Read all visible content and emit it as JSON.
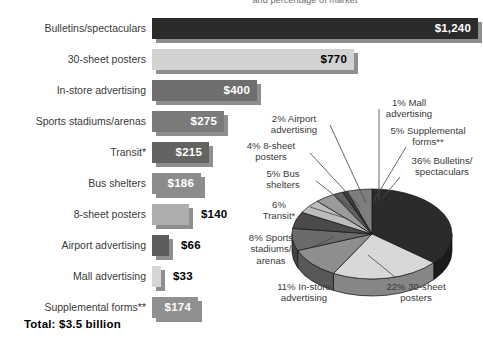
{
  "title": "and percentage of market",
  "total": "Total: $3.5 billion",
  "chart_data": [
    {
      "type": "bar",
      "title": "Outdoor advertising spending by medium",
      "orientation": "horizontal",
      "xlabel": "",
      "ylabel": "",
      "unit": "$ millions",
      "categories": [
        "Bulletins/spectaculars",
        "30-sheet posters",
        "In-store advertising",
        "Sports stadiums/arenas",
        "Transit*",
        "Bus shelters",
        "8-sheet posters",
        "Airport advertising",
        "Mall advertising",
        "Supplemental forms**"
      ],
      "values": [
        1240,
        770,
        400,
        275,
        215,
        186,
        140,
        66,
        33,
        174
      ],
      "value_labels": [
        "$1,240",
        "$770",
        "$400",
        "$275",
        "$215",
        "$186",
        "$140",
        "$66",
        "$33",
        "$174"
      ],
      "colors": [
        "#2b2b2b",
        "#d2d2d2",
        "#6e6e6e",
        "#7b7b7b",
        "#636363",
        "#8c8c8c",
        "#adadad",
        "#5d5d5d",
        "#d6d6d6",
        "#909090"
      ],
      "label_inside": [
        true,
        true,
        true,
        true,
        true,
        true,
        false,
        false,
        false,
        true
      ],
      "label_color": [
        "#ffffff",
        "#000000",
        "#ffffff",
        "#ffffff",
        "#ffffff",
        "#ffffff",
        "#000000",
        "#000000",
        "#000000",
        "#ffffff"
      ],
      "shadow_color": "#8e8e8e",
      "bar_height_px": 21,
      "row_pitch_px": 31,
      "max_value": 1240,
      "max_width_px": 326,
      "grid": false,
      "total": "Total: $3.5 billion"
    },
    {
      "type": "pie",
      "title": "Percentage of market",
      "three_d": true,
      "legend": "callout-labels",
      "labels": [
        "36% Bulletins/spectaculars",
        "22% 30-sheet posters",
        "11% In-store advertising",
        "8% Sports stadiums/arenas",
        "6% Transit*",
        "5% Bus shelters",
        "4% 8-sheet posters",
        "2% Airport advertising",
        "1% Mall advertising",
        "5% Supplemental forms**"
      ],
      "categories": [
        "Bulletins/spectaculars",
        "30-sheet posters",
        "In-store advertising",
        "Sports stadiums/arenas",
        "Transit*",
        "Bus shelters",
        "8-sheet posters",
        "Airport advertising",
        "Mall advertising",
        "Supplemental forms**"
      ],
      "values": [
        36,
        22,
        11,
        8,
        6,
        5,
        4,
        2,
        1,
        5
      ],
      "colors": [
        "#2b2b2b",
        "#d8d8d8",
        "#8e8e8e",
        "#6b6b6b",
        "#4a4a4a",
        "#bdbdbd",
        "#9a9a9a",
        "#636363",
        "#3a3a3a",
        "#7e7e7e"
      ],
      "center_px": [
        372,
        234
      ],
      "radius_x_px": 80,
      "radius_y_px": 45,
      "depth_px": 17,
      "start_angle_deg": -90
    }
  ],
  "pie_callouts": [
    {
      "name": "mall-advertising",
      "text": "1% Mall\nadvertising",
      "x": 143,
      "y": 2,
      "w": 72,
      "align": "c"
    },
    {
      "name": "airport-advertising",
      "text": "2% Airport\nadvertising",
      "x": 24,
      "y": 18,
      "w": 80,
      "align": "c"
    },
    {
      "name": "supplemental-forms",
      "text": "5% Supplemental\nforms**",
      "x": 148,
      "y": 30,
      "w": 100,
      "align": "c"
    },
    {
      "name": "eight-sheet-posters",
      "text": "4% 8-sheet\nposters",
      "x": 3,
      "y": 45,
      "w": 76,
      "align": "c"
    },
    {
      "name": "bulletins-spectaculars",
      "text": "36% Bulletins/\nspectaculars",
      "x": 170,
      "y": 60,
      "w": 84,
      "align": "c"
    },
    {
      "name": "bus-shelters",
      "text": "5% Bus\nshelters",
      "x": 22,
      "y": 73,
      "w": 62,
      "align": "c"
    },
    {
      "name": "transit",
      "text": "6%\nTransit*",
      "x": 19,
      "y": 104,
      "w": 60,
      "align": "c"
    },
    {
      "name": "sports-stadiums-arenas",
      "text": "8% Sports\nstadiums/\narenas",
      "x": 3,
      "y": 137,
      "w": 76,
      "align": "c"
    },
    {
      "name": "in-store-advertising",
      "text": "11% In-store\nadvertising",
      "x": 31,
      "y": 186,
      "w": 86,
      "align": "c"
    },
    {
      "name": "thirty-sheet-posters",
      "text": "22% 30-sheet\nposters",
      "x": 142,
      "y": 186,
      "w": 88,
      "align": "c"
    }
  ],
  "callout_lines": [
    {
      "name": "leader-mall",
      "x1": 149,
      "y1": 14,
      "x2": 149,
      "y2": 106,
      "bend": true
    },
    {
      "name": "leader-airport",
      "x1": 100,
      "y1": 30,
      "x2": 136,
      "y2": 108
    },
    {
      "name": "leader-supplemental",
      "x1": 176,
      "y1": 52,
      "x2": 143,
      "y2": 107
    },
    {
      "name": "leader-8sheet",
      "x1": 80,
      "y1": 58,
      "x2": 130,
      "y2": 112
    },
    {
      "name": "leader-bulletins",
      "x1": 170,
      "y1": 82,
      "x2": 152,
      "y2": 104
    },
    {
      "name": "leader-bus",
      "x1": 86,
      "y1": 86,
      "x2": 125,
      "y2": 116
    },
    {
      "name": "leader-transit",
      "x1": 80,
      "y1": 112,
      "x2": 118,
      "y2": 124
    },
    {
      "name": "leader-sports",
      "x1": 82,
      "y1": 152,
      "x2": 104,
      "y2": 142
    },
    {
      "name": "leader-instore",
      "x1": 76,
      "y1": 182,
      "x2": 62,
      "y2": 158
    },
    {
      "name": "leader-30sheet",
      "x1": 165,
      "y1": 182,
      "x2": 138,
      "y2": 160
    }
  ]
}
